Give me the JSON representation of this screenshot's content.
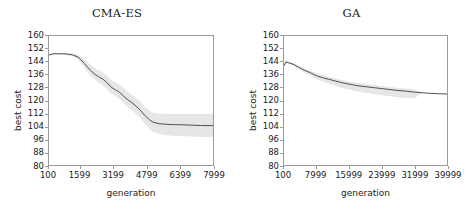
{
  "figure": {
    "background": "#ffffff",
    "line_color": "#4d4d4d",
    "band_color": "#e6e6e6",
    "axis_color": "#9a9a9a"
  },
  "chart_data": [
    {
      "type": "line",
      "title": "CMA-ES",
      "xlabel": "generation",
      "ylabel": "best cost",
      "xlim": [
        100,
        7999
      ],
      "ylim": [
        80,
        160
      ],
      "grid": false,
      "legend": "none",
      "xticks": [
        100,
        1599,
        3199,
        4799,
        6399,
        7999
      ],
      "xticklabels": [
        "100",
        "1599",
        "3199",
        "4799",
        "6399",
        "7999"
      ],
      "yticks": [
        80,
        88,
        96,
        104,
        112,
        120,
        128,
        136,
        144,
        152,
        160
      ],
      "yticklabels": [
        "80",
        "88",
        "96",
        "104",
        "112",
        "120",
        "128",
        "136",
        "144",
        "152",
        "160"
      ],
      "series": [
        {
          "name": "mean best cost",
          "x": [
            100,
            300,
            600,
            900,
            1200,
            1500,
            1800,
            2100,
            2300,
            2500,
            2700,
            2900,
            3100,
            3300,
            3500,
            3700,
            3900,
            4100,
            4300,
            4500,
            4700,
            4900,
            5100,
            5400,
            5800,
            6200,
            6600,
            7000,
            7400,
            7999
          ],
          "values": [
            148.2,
            149.0,
            149.0,
            148.9,
            148.4,
            147.0,
            143.0,
            138.6,
            136.4,
            134.6,
            133.2,
            131.0,
            128.2,
            126.6,
            125.0,
            122.6,
            120.4,
            118.6,
            116.4,
            114.0,
            111.0,
            108.4,
            106.6,
            105.6,
            105.2,
            105.0,
            104.9,
            104.7,
            104.5,
            104.4
          ],
          "band_lower": [
            148.2,
            148.6,
            148.6,
            148.4,
            147.6,
            145.6,
            140.4,
            135.4,
            133.0,
            131.0,
            129.4,
            127.0,
            124.4,
            122.6,
            121.0,
            118.4,
            116.0,
            114.0,
            111.6,
            109.0,
            105.8,
            102.8,
            100.6,
            99.2,
            98.4,
            98.0,
            97.8,
            97.6,
            97.4,
            97.2
          ],
          "band_upper": [
            148.2,
            149.4,
            149.4,
            149.4,
            149.2,
            148.4,
            145.8,
            142.2,
            140.2,
            138.6,
            137.4,
            135.4,
            132.6,
            131.2,
            129.8,
            127.6,
            125.4,
            123.6,
            121.4,
            119.2,
            116.4,
            114.0,
            112.4,
            111.8,
            111.6,
            111.6,
            111.6,
            111.6,
            111.6,
            111.6
          ]
        }
      ]
    },
    {
      "type": "line",
      "title": "GA",
      "xlabel": "generation",
      "ylabel": "best cost",
      "xlim": [
        100,
        39999
      ],
      "ylim": [
        80,
        160
      ],
      "grid": false,
      "legend": "none",
      "xticks": [
        100,
        7999,
        15999,
        23999,
        31999,
        39999
      ],
      "xticklabels": [
        "100",
        "7999",
        "15999",
        "23999",
        "31999",
        "39999"
      ],
      "yticks": [
        80,
        88,
        96,
        104,
        112,
        120,
        128,
        136,
        144,
        152,
        160
      ],
      "yticklabels": [
        "80",
        "88",
        "96",
        "104",
        "112",
        "120",
        "128",
        "136",
        "144",
        "152",
        "160"
      ],
      "series": [
        {
          "name": "mean best cost",
          "x": [
            100,
            600,
            1200,
            1800,
            2600,
            3600,
            4600,
            5600,
            6600,
            7999,
            9500,
            11000,
            12500,
            14000,
            15999,
            18000,
            20000,
            22000,
            23999,
            26000,
            28000,
            30000,
            31999,
            34000,
            36000,
            38000,
            39999
          ],
          "values": [
            141.6,
            144.0,
            143.4,
            143.0,
            142.2,
            140.8,
            139.4,
            138.2,
            137.2,
            135.4,
            134.2,
            133.2,
            132.2,
            131.2,
            130.2,
            129.2,
            128.6,
            128.0,
            127.4,
            126.8,
            126.2,
            125.8,
            125.2,
            124.8,
            124.4,
            124.2,
            124.0
          ],
          "band_lower": [
            141.0,
            143.2,
            142.6,
            142.2,
            141.2,
            139.6,
            138.0,
            136.6,
            135.4,
            133.4,
            131.8,
            130.4,
            129.2,
            128.0,
            126.8,
            125.6,
            124.8,
            124.0,
            123.2,
            122.6,
            122.0,
            121.6,
            121.2,
            124.8,
            124.4,
            124.2,
            124.0
          ],
          "band_upper": [
            142.2,
            144.6,
            144.0,
            143.6,
            142.8,
            141.6,
            140.4,
            139.4,
            138.6,
            137.0,
            135.8,
            134.8,
            133.8,
            132.8,
            131.8,
            130.8,
            130.2,
            129.6,
            129.0,
            128.4,
            127.8,
            127.4,
            126.8,
            124.8,
            124.4,
            124.2,
            124.0
          ]
        }
      ]
    }
  ]
}
